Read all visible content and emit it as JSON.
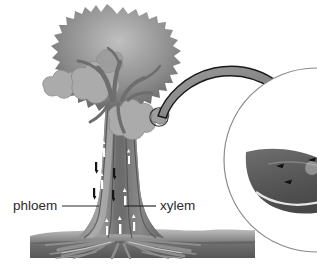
{
  "figure": {
    "name": "tree-vascular-transport-diagram",
    "background_color": "#ffffff"
  },
  "labels": {
    "phloem": "phloem",
    "xylem": "xylem"
  },
  "parts": {
    "canopy": "tree-canopy",
    "trunk": "tree-trunk",
    "roots": "tree-roots",
    "ground": "ground-soil-band",
    "leaf_highlight_circle": "leaf-highlight-circle",
    "zoom_arrow": "magnify-arrow",
    "magnified_circle": "magnified-leaf-circle",
    "magnified_leaf": "magnified-leaf-cross-section"
  },
  "flow": {
    "phloem_direction": "down",
    "xylem_direction": "up",
    "phloem_marker_color": "#1a1a1a",
    "xylem_marker_color": "#ffffff"
  },
  "colors": {
    "canopy_light": "#b4b4b4",
    "canopy_mid": "#8f8f8f",
    "canopy_dark": "#6f6f6f",
    "leaf_cluster": "#a8a8a8",
    "trunk_light": "#9a9a9a",
    "trunk_dark": "#6a6a6a",
    "ground_light": "#b0b0b0",
    "ground_dark": "#5c5c5c",
    "arrow_fill": "#8a8a8a",
    "outline": "#1a1a1a",
    "label_text": "#2b2b2b",
    "leader_line": "#2b2b2b",
    "circle_stroke": "#8a8a8a"
  }
}
